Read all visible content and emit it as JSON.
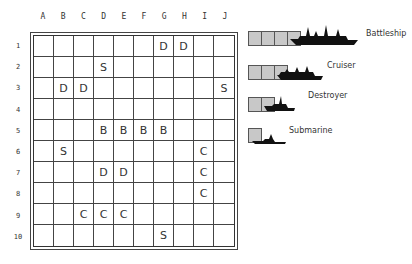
{
  "board": {
    "columns": [
      "A",
      "B",
      "C",
      "D",
      "E",
      "F",
      "G",
      "H",
      "I",
      "J"
    ],
    "rows": [
      "1",
      "2",
      "3",
      "4",
      "5",
      "6",
      "7",
      "8",
      "9",
      "10"
    ],
    "grid": [
      [
        "",
        "",
        "",
        "",
        "",
        "",
        "D",
        "D",
        "",
        ""
      ],
      [
        "",
        "",
        "",
        "S",
        "",
        "",
        "",
        "",
        "",
        ""
      ],
      [
        "",
        "D",
        "D",
        "",
        "",
        "",
        "",
        "",
        "",
        "S"
      ],
      [
        "",
        "",
        "",
        "",
        "",
        "",
        "",
        "",
        "",
        ""
      ],
      [
        "",
        "",
        "",
        "B",
        "B",
        "B",
        "B",
        "",
        "",
        ""
      ],
      [
        "",
        "S",
        "",
        "",
        "",
        "",
        "",
        "",
        "C",
        ""
      ],
      [
        "",
        "",
        "",
        "D",
        "D",
        "",
        "",
        "",
        "C",
        ""
      ],
      [
        "",
        "",
        "",
        "",
        "",
        "",
        "",
        "",
        "C",
        ""
      ],
      [
        "",
        "",
        "C",
        "C",
        "C",
        "",
        "",
        "",
        "",
        ""
      ],
      [
        "",
        "",
        "",
        "",
        "",
        "",
        "S",
        "",
        "",
        ""
      ]
    ]
  },
  "legend": {
    "items": [
      {
        "name": "Battleship",
        "size": 4,
        "icon": "battleship-icon"
      },
      {
        "name": "Cruiser",
        "size": 3,
        "icon": "cruiser-icon"
      },
      {
        "name": "Destroyer",
        "size": 2,
        "icon": "destroyer-icon"
      },
      {
        "name": "Submarine",
        "size": 1,
        "icon": "submarine-icon"
      }
    ]
  },
  "colors": {
    "ship_box": "#c8c8c8",
    "ship_silhouette": "#111111",
    "grid_line": "#444444"
  }
}
